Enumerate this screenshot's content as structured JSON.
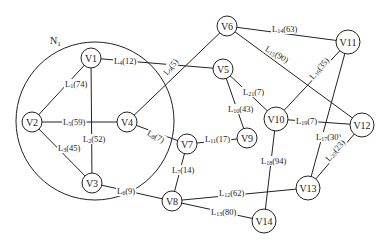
{
  "diagram": {
    "type": "network-graph",
    "regions": [
      {
        "id": "N1",
        "label": "N",
        "sub": "1",
        "cx": 95,
        "cy": 121,
        "r": 79,
        "label_x": 50,
        "label_y": 44
      }
    ],
    "nodes": [
      {
        "id": "V1",
        "label": "V1",
        "x": 91,
        "y": 58,
        "r": 10
      },
      {
        "id": "V2",
        "label": "V2",
        "x": 32,
        "y": 122,
        "r": 10
      },
      {
        "id": "V3",
        "label": "V3",
        "x": 92,
        "y": 183,
        "r": 10
      },
      {
        "id": "V4",
        "label": "V4",
        "x": 127,
        "y": 122,
        "r": 10
      },
      {
        "id": "V5",
        "label": "V5",
        "x": 223,
        "y": 69,
        "r": 10
      },
      {
        "id": "V6",
        "label": "V6",
        "x": 227,
        "y": 26,
        "r": 10
      },
      {
        "id": "V7",
        "label": "V7",
        "x": 187,
        "y": 144,
        "r": 10
      },
      {
        "id": "V8",
        "label": "V8",
        "x": 172,
        "y": 201,
        "r": 10
      },
      {
        "id": "V9",
        "label": "V9",
        "x": 247,
        "y": 138,
        "r": 10
      },
      {
        "id": "V10",
        "label": "V10",
        "x": 276,
        "y": 119,
        "r": 12
      },
      {
        "id": "V11",
        "label": "V11",
        "x": 348,
        "y": 42,
        "r": 12
      },
      {
        "id": "V12",
        "label": "V12",
        "x": 362,
        "y": 125,
        "r": 12
      },
      {
        "id": "V13",
        "label": "V13",
        "x": 308,
        "y": 188,
        "r": 12
      },
      {
        "id": "V14",
        "label": "V14",
        "x": 264,
        "y": 221,
        "r": 12
      }
    ],
    "edges": [
      {
        "id": "L1",
        "from": "V1",
        "to": "V2",
        "name": "L",
        "sub": "1",
        "weight": "(74)",
        "lx": 65,
        "ly": 84,
        "rot": 0
      },
      {
        "id": "L2",
        "from": "V1",
        "to": "V3",
        "name": "L",
        "sub": "2",
        "weight": "(52)",
        "lx": 83,
        "ly": 139,
        "rot": 0
      },
      {
        "id": "L3",
        "from": "V2",
        "to": "V3",
        "name": "L",
        "sub": "3",
        "weight": "(45)",
        "lx": 58,
        "ly": 148,
        "rot": 0
      },
      {
        "id": "L4",
        "from": "V1",
        "to": "V5",
        "name": "L",
        "sub": "4",
        "weight": "(12)",
        "lx": 114,
        "ly": 61,
        "rot": 0
      },
      {
        "id": "L5",
        "from": "V2",
        "to": "V4",
        "name": "L",
        "sub": "5",
        "weight": "(59)",
        "lx": 63,
        "ly": 122,
        "rot": 0
      },
      {
        "id": "L6",
        "from": "V3",
        "to": "V8",
        "name": "L",
        "sub": "6",
        "weight": "(9)",
        "lx": 117,
        "ly": 191,
        "rot": 0
      },
      {
        "id": "L7",
        "from": "V7",
        "to": "V8",
        "name": "L",
        "sub": "7",
        "weight": "(14)",
        "lx": 172,
        "ly": 170,
        "rot": 0
      },
      {
        "id": "L8",
        "from": "V4",
        "to": "V7",
        "name": "L",
        "sub": "8",
        "weight": "(7)",
        "lx": 148,
        "ly": 132,
        "rot": 28
      },
      {
        "id": "L9",
        "from": "V4",
        "to": "V6",
        "name": "L",
        "sub": "9",
        "weight": "(5)",
        "lx": 165,
        "ly": 74,
        "rot": -52
      },
      {
        "id": "L10",
        "from": "V5",
        "to": "V9",
        "name": "L",
        "sub": "10",
        "weight": "(43)",
        "lx": 228,
        "ly": 109,
        "rot": 0
      },
      {
        "id": "L11",
        "from": "V7",
        "to": "V9",
        "name": "L",
        "sub": "11",
        "weight": "(17)",
        "lx": 205,
        "ly": 139,
        "rot": 0
      },
      {
        "id": "L12",
        "from": "V8",
        "to": "V13",
        "name": "L",
        "sub": "12",
        "weight": "(62)",
        "lx": 219,
        "ly": 193,
        "rot": 0
      },
      {
        "id": "L13",
        "from": "V8",
        "to": "V14",
        "name": "L",
        "sub": "13",
        "weight": "(80)",
        "lx": 211,
        "ly": 212,
        "rot": 0
      },
      {
        "id": "L14",
        "from": "V6",
        "to": "V11",
        "name": "L",
        "sub": "14",
        "weight": "(63)",
        "lx": 272,
        "ly": 29,
        "rot": 0
      },
      {
        "id": "L15",
        "from": "V6",
        "to": "V12",
        "name": "L",
        "sub": "15",
        "weight": "(90)",
        "lx": 266,
        "ly": 48,
        "rot": 30
      },
      {
        "id": "L16",
        "from": "V10",
        "to": "V11",
        "name": "L",
        "sub": "16",
        "weight": "(35)",
        "lx": 311,
        "ly": 78,
        "rot": -50
      },
      {
        "id": "L17",
        "from": "V11",
        "to": "V13",
        "name": "L",
        "sub": "17",
        "weight": "(30)",
        "lx": 316,
        "ly": 137,
        "rot": 0
      },
      {
        "id": "L18",
        "from": "V10",
        "to": "V14",
        "name": "L",
        "sub": "18",
        "weight": "(94)",
        "lx": 261,
        "ly": 161,
        "rot": 0
      },
      {
        "id": "L19",
        "from": "V10",
        "to": "V12",
        "name": "L",
        "sub": "19",
        "weight": "(7)",
        "lx": 296,
        "ly": 121,
        "rot": 0
      },
      {
        "id": "L20",
        "from": "V12",
        "to": "V13",
        "name": "L",
        "sub": "20",
        "weight": "(23)",
        "lx": 327,
        "ly": 160,
        "rot": -50
      },
      {
        "id": "L21",
        "from": "V5",
        "to": "V10",
        "name": "L",
        "sub": "21",
        "weight": "(7)",
        "lx": 243,
        "ly": 92,
        "rot": 0
      }
    ]
  }
}
